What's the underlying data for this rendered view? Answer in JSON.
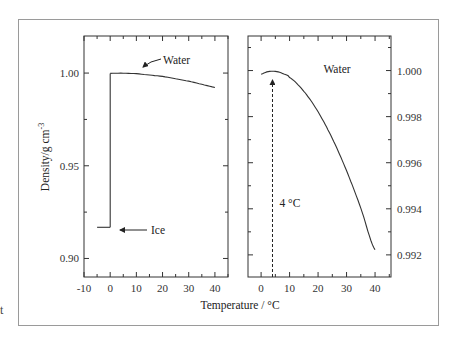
{
  "figure": {
    "stray_text": "t",
    "x_axis_label": "Temperature / °C",
    "left_y_axis_label": "Density/g cm",
    "left_y_axis_label_sup": "-3"
  },
  "chart_data": [
    {
      "type": "line",
      "panel": "left",
      "title": "",
      "xlabel": "Temperature / °C",
      "ylabel": "Density/g cm-3",
      "xlim": [
        -10,
        45
      ],
      "ylim": [
        0.89,
        1.02
      ],
      "x_ticks": [
        -10,
        0,
        10,
        20,
        30,
        40
      ],
      "x_tick_labels": [
        "-10",
        "0",
        "10",
        "20",
        "30",
        "40"
      ],
      "y_ticks": [
        0.9,
        0.95,
        1.0
      ],
      "y_tick_labels": [
        "0.90",
        "0.95",
        "1.00"
      ],
      "grid": false,
      "series": [
        {
          "name": "Ice",
          "x": [
            -5,
            0
          ],
          "values": [
            0.9168,
            0.9168
          ]
        },
        {
          "name": "Phase transition",
          "x": [
            0,
            0
          ],
          "values": [
            0.9168,
            0.99984
          ]
        },
        {
          "name": "Water",
          "x": [
            0,
            4,
            10,
            20,
            30,
            40
          ],
          "values": [
            0.99984,
            0.99997,
            0.9997,
            0.99821,
            0.99565,
            0.99222
          ]
        }
      ],
      "annotations": [
        {
          "text": "Water",
          "arrow_to": [
            8,
            0.9995
          ]
        },
        {
          "text": "Ice",
          "arrow_to": [
            4,
            0.9168
          ]
        }
      ]
    },
    {
      "type": "line",
      "panel": "right",
      "title": "",
      "xlabel": "Temperature / °C",
      "ylabel": "",
      "y_axis_side": "right",
      "xlim": [
        -4.6,
        45.6
      ],
      "ylim": [
        0.99104,
        1.0015
      ],
      "x_ticks": [
        0,
        10,
        20,
        30,
        40
      ],
      "x_tick_labels": [
        "0",
        "10",
        "20",
        "30",
        "40"
      ],
      "y_ticks": [
        0.992,
        0.994,
        0.996,
        0.998,
        1.0
      ],
      "y_tick_labels": [
        "0.992",
        "0.994",
        "0.996",
        "0.998",
        "1.000"
      ],
      "grid": false,
      "series": [
        {
          "name": "Water",
          "x": [
            0,
            2,
            4,
            6,
            8,
            10,
            15,
            20,
            25,
            30,
            35,
            40
          ],
          "values": [
            0.99984,
            0.99994,
            0.99997,
            0.99994,
            0.99985,
            0.9997,
            0.9991,
            0.99821,
            0.99705,
            0.99565,
            0.99403,
            0.99222
          ]
        }
      ],
      "annotations": [
        {
          "text": "Water",
          "position": [
            30,
            1.0
          ]
        },
        {
          "text": "4 °C",
          "type": "dashed-vertical-arrow",
          "x": 4
        }
      ]
    }
  ]
}
